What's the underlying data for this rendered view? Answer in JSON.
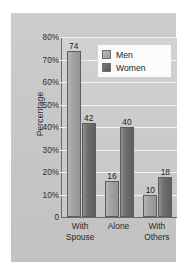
{
  "chart_data": {
    "type": "bar",
    "title": "",
    "xlabel": "",
    "ylabel": "Percentage",
    "ylim": [
      0,
      80
    ],
    "grid": true,
    "legend_position": "top-right",
    "categories": [
      "With Spouse",
      "Alone",
      "With Others"
    ],
    "category_lines": [
      [
        "With",
        "Spouse"
      ],
      [
        "Alone",
        ""
      ],
      [
        "With",
        "Others"
      ]
    ],
    "series": [
      {
        "name": "Men",
        "color": "#a2a2a2",
        "values": [
          74,
          16,
          10
        ]
      },
      {
        "name": "Women",
        "color": "#6e6e6e",
        "values": [
          42,
          40,
          18
        ]
      }
    ],
    "y_ticks": [
      {
        "value": 80,
        "label": "80%"
      },
      {
        "value": 70,
        "label": "70%"
      },
      {
        "value": 60,
        "label": "60%"
      },
      {
        "value": 50,
        "label": "50%"
      },
      {
        "value": 40,
        "label": "40%"
      },
      {
        "value": 30,
        "label": "30%"
      },
      {
        "value": 20,
        "label": "20%"
      },
      {
        "value": 10,
        "label": "10%"
      },
      {
        "value": 0,
        "label": "0"
      }
    ],
    "value_labels": [
      "74",
      "42",
      "16",
      "40",
      "10",
      "18"
    ]
  },
  "legend": {
    "items": [
      {
        "label": "Men"
      },
      {
        "label": "Women"
      }
    ]
  },
  "axis": {
    "y_title": "Percentage"
  }
}
